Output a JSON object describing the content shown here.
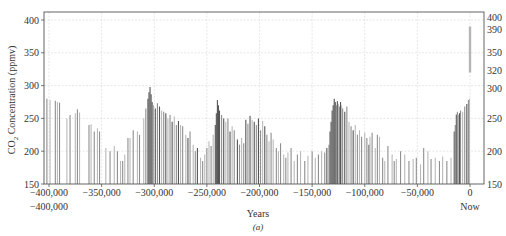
{
  "chart_data": {
    "type": "bar",
    "title": "",
    "caption": "(a)",
    "xlabel": "Years",
    "ylabel": "CO2 Concentration (ppmv)",
    "ylabel_parts": {
      "pre": "CO",
      "sub": "2",
      "post": " Concentration (ppmv)"
    },
    "xlim": [
      -410000,
      5000
    ],
    "ylim": [
      150,
      412
    ],
    "grid": true,
    "x_ticks": [
      -400000,
      -350000,
      -300000,
      -250000,
      -200000,
      -150000,
      -100000,
      -50000,
      0
    ],
    "x_tick_labels": [
      "−400,000",
      "−350,000",
      "−300,000",
      "−250,000",
      "−200,000",
      "−150,000",
      "−100,000",
      "−50,000",
      "0"
    ],
    "x_extra_labels": [
      {
        "x": -400000,
        "label": "−400,000"
      },
      {
        "x": 0,
        "label": "Now"
      }
    ],
    "y_ticks_left": [
      150,
      200,
      250,
      300,
      350,
      400
    ],
    "y_ticks_right": [
      150,
      200,
      250,
      300,
      320,
      350,
      390,
      400
    ],
    "modern_range": {
      "x": 0,
      "y_low": 320,
      "y_high": 390,
      "color": "#b5b5b5"
    },
    "colors": {
      "light": "#b9b9b9",
      "mid": "#8e8e8e",
      "dark": "#555555",
      "grid": "#dcdcdc",
      "axis": "#555555"
    },
    "bars": [
      [
        -402000,
        280,
        "m"
      ],
      [
        -399000,
        278,
        "l"
      ],
      [
        -394000,
        277,
        "m"
      ],
      [
        -392000,
        275,
        "l"
      ],
      [
        -390000,
        274,
        "m"
      ],
      [
        -383000,
        250,
        "l"
      ],
      [
        -380000,
        255,
        "m"
      ],
      [
        -375000,
        258,
        "l"
      ],
      [
        -373000,
        264,
        "m"
      ],
      [
        -371000,
        259,
        "l"
      ],
      [
        -362000,
        240,
        "m"
      ],
      [
        -360000,
        241,
        "l"
      ],
      [
        -357000,
        230,
        "m"
      ],
      [
        -354000,
        235,
        "l"
      ],
      [
        -352000,
        230,
        "m"
      ],
      [
        -346000,
        205,
        "l"
      ],
      [
        -342000,
        200,
        "m"
      ],
      [
        -338000,
        208,
        "l"
      ],
      [
        -335000,
        200,
        "m"
      ],
      [
        -332000,
        185,
        "l"
      ],
      [
        -330000,
        185,
        "m"
      ],
      [
        -328000,
        195,
        "l"
      ],
      [
        -325000,
        220,
        "m"
      ],
      [
        -323000,
        220,
        "l"
      ],
      [
        -320000,
        232,
        "m"
      ],
      [
        -316000,
        230,
        "l"
      ],
      [
        -314000,
        225,
        "m"
      ],
      [
        -310000,
        250,
        "l"
      ],
      [
        -308000,
        265,
        "m"
      ],
      [
        -306000,
        280,
        "d"
      ],
      [
        -305000,
        290,
        "d"
      ],
      [
        -304000,
        298,
        "d"
      ],
      [
        -303000,
        287,
        "d"
      ],
      [
        -302000,
        275,
        "d"
      ],
      [
        -301000,
        270,
        "m"
      ],
      [
        -299000,
        265,
        "d"
      ],
      [
        -297000,
        273,
        "m"
      ],
      [
        -295000,
        268,
        "d"
      ],
      [
        -293000,
        262,
        "l"
      ],
      [
        -291000,
        260,
        "m"
      ],
      [
        -289000,
        258,
        "d"
      ],
      [
        -287000,
        250,
        "l"
      ],
      [
        -285000,
        255,
        "m"
      ],
      [
        -283000,
        245,
        "d"
      ],
      [
        -281000,
        253,
        "l"
      ],
      [
        -279000,
        240,
        "m"
      ],
      [
        -277000,
        246,
        "d"
      ],
      [
        -275000,
        240,
        "l"
      ],
      [
        -273000,
        238,
        "m"
      ],
      [
        -270000,
        225,
        "l"
      ],
      [
        -268000,
        220,
        "d"
      ],
      [
        -266000,
        230,
        "m"
      ],
      [
        -263000,
        210,
        "l"
      ],
      [
        -261000,
        200,
        "m"
      ],
      [
        -259000,
        205,
        "d"
      ],
      [
        -256000,
        190,
        "l"
      ],
      [
        -254000,
        185,
        "m"
      ],
      [
        -252000,
        195,
        "l"
      ],
      [
        -250000,
        205,
        "m"
      ],
      [
        -248000,
        215,
        "l"
      ],
      [
        -246000,
        208,
        "m"
      ],
      [
        -244000,
        225,
        "l"
      ],
      [
        -242000,
        240,
        "d"
      ],
      [
        -241000,
        258,
        "d"
      ],
      [
        -240000,
        278,
        "d"
      ],
      [
        -239000,
        270,
        "d"
      ],
      [
        -238000,
        262,
        "d"
      ],
      [
        -236000,
        255,
        "m"
      ],
      [
        -234000,
        250,
        "d"
      ],
      [
        -232000,
        245,
        "l"
      ],
      [
        -230000,
        250,
        "m"
      ],
      [
        -228000,
        230,
        "d"
      ],
      [
        -226000,
        238,
        "l"
      ],
      [
        -224000,
        232,
        "m"
      ],
      [
        -221000,
        218,
        "d"
      ],
      [
        -219000,
        210,
        "m"
      ],
      [
        -217000,
        220,
        "l"
      ],
      [
        -215000,
        212,
        "m"
      ],
      [
        -213000,
        248,
        "d"
      ],
      [
        -211000,
        242,
        "m"
      ],
      [
        -209000,
        254,
        "d"
      ],
      [
        -207000,
        248,
        "l"
      ],
      [
        -205000,
        245,
        "d"
      ],
      [
        -203000,
        240,
        "m"
      ],
      [
        -201000,
        250,
        "d"
      ],
      [
        -199000,
        232,
        "m"
      ],
      [
        -197000,
        246,
        "l"
      ],
      [
        -195000,
        238,
        "d"
      ],
      [
        -193000,
        225,
        "m"
      ],
      [
        -191000,
        215,
        "l"
      ],
      [
        -189000,
        228,
        "m"
      ],
      [
        -187000,
        218,
        "l"
      ],
      [
        -184000,
        205,
        "m"
      ],
      [
        -182000,
        200,
        "l"
      ],
      [
        -180000,
        212,
        "m"
      ],
      [
        -177000,
        195,
        "l"
      ],
      [
        -175000,
        190,
        "m"
      ],
      [
        -173000,
        198,
        "l"
      ],
      [
        -170000,
        205,
        "m"
      ],
      [
        -167000,
        185,
        "l"
      ],
      [
        -164000,
        195,
        "m"
      ],
      [
        -161000,
        200,
        "l"
      ],
      [
        -157000,
        185,
        "m"
      ],
      [
        -154000,
        193,
        "l"
      ],
      [
        -150000,
        200,
        "m"
      ],
      [
        -147000,
        190,
        "l"
      ],
      [
        -144000,
        195,
        "m"
      ],
      [
        -141000,
        200,
        "l"
      ],
      [
        -138000,
        198,
        "m"
      ],
      [
        -136000,
        205,
        "d"
      ],
      [
        -134000,
        210,
        "m"
      ],
      [
        -133000,
        230,
        "d"
      ],
      [
        -132000,
        245,
        "d"
      ],
      [
        -131000,
        262,
        "d"
      ],
      [
        -130000,
        270,
        "d"
      ],
      [
        -129000,
        280,
        "d"
      ],
      [
        -128000,
        275,
        "d"
      ],
      [
        -127000,
        270,
        "m"
      ],
      [
        -126000,
        276,
        "d"
      ],
      [
        -125000,
        272,
        "l"
      ],
      [
        -124000,
        268,
        "m"
      ],
      [
        -123000,
        275,
        "d"
      ],
      [
        -122000,
        270,
        "l"
      ],
      [
        -121000,
        265,
        "m"
      ],
      [
        -119000,
        260,
        "d"
      ],
      [
        -117000,
        268,
        "m"
      ],
      [
        -115000,
        245,
        "l"
      ],
      [
        -113000,
        238,
        "m"
      ],
      [
        -111000,
        232,
        "d"
      ],
      [
        -109000,
        240,
        "l"
      ],
      [
        -107000,
        225,
        "m"
      ],
      [
        -105000,
        232,
        "l"
      ],
      [
        -103000,
        222,
        "m"
      ],
      [
        -100000,
        228,
        "l"
      ],
      [
        -98000,
        220,
        "m"
      ],
      [
        -96000,
        210,
        "d"
      ],
      [
        -95000,
        222,
        "l"
      ],
      [
        -93000,
        228,
        "m"
      ],
      [
        -90000,
        205,
        "l"
      ],
      [
        -88000,
        225,
        "m"
      ],
      [
        -86000,
        222,
        "l"
      ],
      [
        -83000,
        190,
        "m"
      ],
      [
        -81000,
        185,
        "l"
      ],
      [
        -78000,
        208,
        "m"
      ],
      [
        -74000,
        195,
        "l"
      ],
      [
        -72000,
        185,
        "m"
      ],
      [
        -70000,
        188,
        "l"
      ],
      [
        -66000,
        200,
        "m"
      ],
      [
        -62000,
        195,
        "l"
      ],
      [
        -58000,
        185,
        "m"
      ],
      [
        -54000,
        188,
        "l"
      ],
      [
        -51000,
        190,
        "m"
      ],
      [
        -47000,
        180,
        "l"
      ],
      [
        -44000,
        205,
        "m"
      ],
      [
        -40000,
        200,
        "l"
      ],
      [
        -37000,
        188,
        "m"
      ],
      [
        -33000,
        190,
        "l"
      ],
      [
        -29000,
        185,
        "m"
      ],
      [
        -26000,
        192,
        "l"
      ],
      [
        -22000,
        185,
        "m"
      ],
      [
        -18000,
        190,
        "l"
      ],
      [
        -15000,
        230,
        "d"
      ],
      [
        -14000,
        240,
        "m"
      ],
      [
        -13000,
        256,
        "d"
      ],
      [
        -12000,
        260,
        "m"
      ],
      [
        -11000,
        255,
        "l"
      ],
      [
        -10000,
        258,
        "d"
      ],
      [
        -9000,
        262,
        "m"
      ],
      [
        -7000,
        260,
        "l"
      ],
      [
        -5000,
        268,
        "m"
      ],
      [
        -3000,
        272,
        "d"
      ],
      [
        -1500,
        278,
        "m"
      ],
      [
        -500,
        280,
        "l"
      ]
    ]
  }
}
